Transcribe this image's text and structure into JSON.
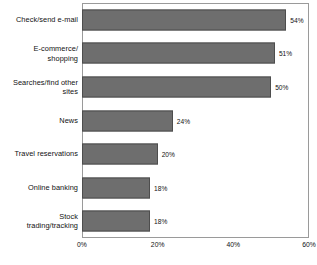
{
  "chart_data": {
    "type": "bar",
    "orientation": "horizontal",
    "title": "",
    "xlabel": "",
    "ylabel": "",
    "xlim": [
      0,
      60
    ],
    "xticks": [
      0,
      20,
      40,
      60
    ],
    "xtick_labels": [
      "0%",
      "20%",
      "40%",
      "60%"
    ],
    "grid": false,
    "legend": null,
    "value_suffix": "%",
    "categories": [
      "Check/send e-mail",
      "E-commerce/\nshopping",
      "Searches/find other\nsites",
      "News",
      "Travel reservations",
      "Online banking",
      "Stock\ntrading/tracking"
    ],
    "values": [
      54,
      51,
      50,
      24,
      20,
      18,
      18
    ],
    "value_labels": [
      "54%",
      "51%",
      "50%",
      "24%",
      "20%",
      "18%",
      "18%"
    ],
    "colors": {
      "bar_fill": "#6e6e6e",
      "bar_outline": "#4d4d4d",
      "plot_border": "#9a9a9a",
      "text": "#111111",
      "background": "#ffffff"
    }
  },
  "footnote": {
    "text": ""
  }
}
